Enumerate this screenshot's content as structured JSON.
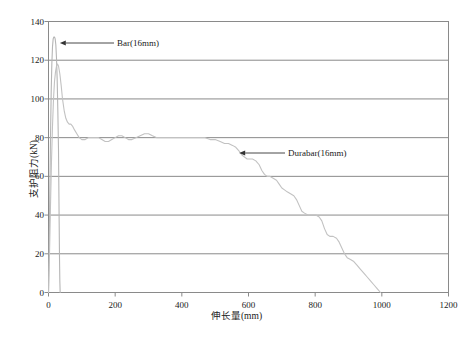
{
  "chart_data": {
    "type": "line",
    "title": "",
    "xlabel": "伸长量(mm)",
    "ylabel": "支护阻力(kN)",
    "xlim": [
      0,
      1200
    ],
    "ylim": [
      0,
      140
    ],
    "xticks": [
      0,
      200,
      400,
      600,
      800,
      1000,
      1200
    ],
    "yticks": [
      0,
      20,
      40,
      60,
      80,
      100,
      120,
      140
    ],
    "grid": "horizontal",
    "legend_position": "inline-annotations",
    "annotations": [
      {
        "text": "Bar(16mm)",
        "points_to_x": 22,
        "points_to_y": 128
      },
      {
        "text": "Durabar(16mm)",
        "points_to_x": 560,
        "points_to_y": 76
      }
    ],
    "series": [
      {
        "name": "Bar(16mm)",
        "color": "#b5b5b5",
        "points": [
          [
            0,
            0
          ],
          [
            2,
            22
          ],
          [
            4,
            52
          ],
          [
            6,
            80
          ],
          [
            8,
            103
          ],
          [
            10,
            118
          ],
          [
            12,
            127
          ],
          [
            14,
            131
          ],
          [
            16,
            132
          ],
          [
            18,
            132
          ],
          [
            20,
            131
          ],
          [
            22,
            128
          ],
          [
            24,
            121
          ],
          [
            26,
            110
          ],
          [
            28,
            94
          ],
          [
            30,
            74
          ],
          [
            31,
            55
          ],
          [
            32,
            36
          ],
          [
            33,
            18
          ],
          [
            34,
            6
          ],
          [
            35,
            0
          ]
        ]
      },
      {
        "name": "Durabar(16mm)",
        "color": "#c2c2c2",
        "points": [
          [
            0,
            0
          ],
          [
            3,
            20
          ],
          [
            6,
            45
          ],
          [
            9,
            68
          ],
          [
            12,
            86
          ],
          [
            15,
            100
          ],
          [
            18,
            109
          ],
          [
            21,
            114
          ],
          [
            24,
            117
          ],
          [
            27,
            118
          ],
          [
            30,
            117
          ],
          [
            34,
            113
          ],
          [
            38,
            107
          ],
          [
            42,
            100
          ],
          [
            47,
            94
          ],
          [
            52,
            90
          ],
          [
            57,
            88
          ],
          [
            62,
            87
          ],
          [
            67,
            87
          ],
          [
            72,
            86
          ],
          [
            78,
            84
          ],
          [
            85,
            82
          ],
          [
            92,
            80
          ],
          [
            100,
            79
          ],
          [
            110,
            79
          ],
          [
            120,
            80
          ],
          [
            130,
            80
          ],
          [
            140,
            80
          ],
          [
            150,
            80
          ],
          [
            160,
            79
          ],
          [
            170,
            78
          ],
          [
            180,
            78
          ],
          [
            190,
            79
          ],
          [
            200,
            80
          ],
          [
            210,
            81
          ],
          [
            220,
            81
          ],
          [
            230,
            80
          ],
          [
            240,
            79
          ],
          [
            250,
            79
          ],
          [
            262,
            80
          ],
          [
            275,
            81
          ],
          [
            288,
            82
          ],
          [
            300,
            82
          ],
          [
            312,
            81
          ],
          [
            325,
            80
          ],
          [
            338,
            80
          ],
          [
            350,
            80
          ],
          [
            365,
            80
          ],
          [
            380,
            80
          ],
          [
            395,
            80
          ],
          [
            410,
            80
          ],
          [
            425,
            80
          ],
          [
            440,
            80
          ],
          [
            455,
            80
          ],
          [
            470,
            80
          ],
          [
            485,
            79
          ],
          [
            500,
            79
          ],
          [
            515,
            78
          ],
          [
            528,
            77
          ],
          [
            540,
            77
          ],
          [
            552,
            76
          ],
          [
            562,
            75
          ],
          [
            572,
            73
          ],
          [
            580,
            71
          ],
          [
            588,
            70
          ],
          [
            596,
            69
          ],
          [
            604,
            69
          ],
          [
            612,
            69
          ],
          [
            622,
            68
          ],
          [
            632,
            66
          ],
          [
            640,
            63
          ],
          [
            648,
            61
          ],
          [
            656,
            60
          ],
          [
            664,
            60
          ],
          [
            674,
            59
          ],
          [
            684,
            58
          ],
          [
            692,
            56
          ],
          [
            700,
            54
          ],
          [
            708,
            53
          ],
          [
            716,
            52
          ],
          [
            726,
            51
          ],
          [
            736,
            50
          ],
          [
            744,
            48
          ],
          [
            752,
            45
          ],
          [
            760,
            42
          ],
          [
            768,
            41
          ],
          [
            778,
            40
          ],
          [
            790,
            40
          ],
          [
            802,
            40
          ],
          [
            812,
            39
          ],
          [
            820,
            37
          ],
          [
            828,
            33
          ],
          [
            836,
            30
          ],
          [
            844,
            29
          ],
          [
            854,
            29
          ],
          [
            864,
            28
          ],
          [
            872,
            26
          ],
          [
            880,
            23
          ],
          [
            888,
            20
          ],
          [
            896,
            18
          ],
          [
            906,
            17
          ],
          [
            916,
            16
          ],
          [
            926,
            14
          ],
          [
            936,
            12
          ],
          [
            946,
            10
          ],
          [
            956,
            8
          ],
          [
            966,
            6
          ],
          [
            976,
            4
          ],
          [
            986,
            2
          ],
          [
            996,
            0
          ]
        ]
      }
    ]
  },
  "axes": {
    "frame_color": "#8a8a8a",
    "grid_color": "#8a8a8a"
  }
}
